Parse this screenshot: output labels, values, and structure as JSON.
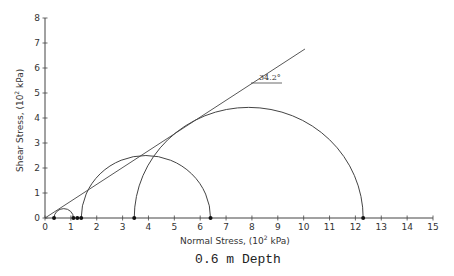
{
  "chart_data": {
    "type": "scatter",
    "title": "0.6 m Depth",
    "xlabel": "Normal Stress, (10² kPa)",
    "ylabel": "Shear Stress, (10² kPa)",
    "xlim": [
      0,
      15
    ],
    "ylim": [
      0,
      8
    ],
    "xticks": [
      0,
      1,
      2,
      3,
      4,
      5,
      6,
      7,
      8,
      9,
      10,
      11,
      12,
      13,
      14,
      15
    ],
    "yticks": [
      0,
      1,
      2,
      3,
      4,
      5,
      6,
      7,
      8
    ],
    "grid": false,
    "mohr_circles": [
      {
        "sigma3": 0.35,
        "sigma1": 1.1,
        "center": 0.725,
        "radius": 0.375
      },
      {
        "sigma3": 1.4,
        "sigma1": 6.4,
        "center": 3.9,
        "radius": 2.5
      },
      {
        "sigma3": 3.45,
        "sigma1": 12.3,
        "center": 7.875,
        "radius": 4.425
      }
    ],
    "points_on_axis": [
      0.35,
      1.1,
      1.25,
      1.4,
      3.45,
      6.4,
      12.3
    ],
    "failure_envelope": {
      "x": [
        0,
        10.05
      ],
      "y": [
        0,
        6.76
      ],
      "friction_angle_deg": 34.2,
      "cohesion": 0
    },
    "annotations": [
      {
        "text": "34.2°",
        "x": 8.8,
        "y": 5.6
      }
    ]
  },
  "labels": {
    "title": "0.6 m Depth",
    "xlabel_main": "Normal Stress, (10",
    "xlabel_sup": "2",
    "xlabel_end": " kPa)",
    "ylabel_main": "Shear Stress, (10",
    "ylabel_sup": "2",
    "ylabel_end": " kPa)",
    "angle": "34.2°"
  }
}
